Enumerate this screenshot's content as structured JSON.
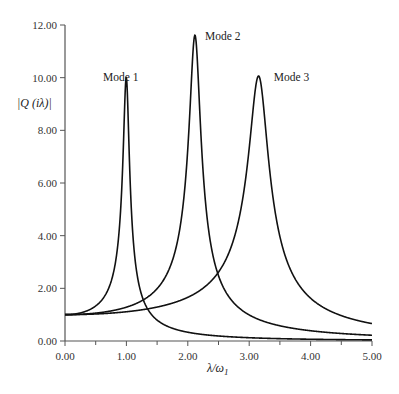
{
  "chart_data": {
    "type": "line",
    "title": "",
    "xlabel": "λ/ω1",
    "ylabel": "|Q (iλ)|",
    "xlim": [
      0,
      5
    ],
    "ylim": [
      0,
      12
    ],
    "grid": false,
    "legend": "none (inline annotations)",
    "x_ticks": [
      "0.00",
      "1.00",
      "2.00",
      "3.00",
      "4.00",
      "5.00"
    ],
    "y_ticks": [
      "0.00",
      "2.00",
      "4.00",
      "6.00",
      "8.00",
      "10.00",
      "12.00"
    ],
    "annotations": [
      {
        "text": "Mode 1",
        "x": 0.62,
        "y": 10.0
      },
      {
        "text": "Mode 2",
        "x": 2.28,
        "y": 11.55
      },
      {
        "text": "Mode 3",
        "x": 3.4,
        "y": 10.0
      }
    ],
    "series": [
      {
        "name": "Mode 1",
        "omega": 1.0,
        "peak_x": 1.0,
        "peak_y": 10.0,
        "x": [
          0,
          0.25,
          0.5,
          0.7,
          0.85,
          0.95,
          1.0,
          1.05,
          1.15,
          1.3,
          1.5,
          2.0,
          3.0,
          4.0,
          5.0
        ],
        "y": [
          1.0,
          1.07,
          1.33,
          1.95,
          3.5,
          7.2,
          10.0,
          7.4,
          3.3,
          1.45,
          0.8,
          0.33,
          0.125,
          0.067,
          0.042
        ]
      },
      {
        "name": "Mode 2",
        "omega": 2.12,
        "peak_x": 2.12,
        "peak_y": 11.6,
        "x": [
          0,
          0.5,
          1.0,
          1.3,
          1.6,
          1.8,
          1.95,
          2.05,
          2.12,
          2.2,
          2.35,
          2.6,
          3.0,
          3.5,
          4.0,
          5.0
        ],
        "y": [
          1.0,
          1.06,
          1.28,
          1.6,
          2.33,
          3.6,
          6.3,
          10.0,
          11.6,
          9.5,
          4.6,
          2.05,
          1.0,
          0.58,
          0.39,
          0.22
        ]
      },
      {
        "name": "Mode 3",
        "omega": 3.16,
        "peak_x": 3.16,
        "peak_y": 10.05,
        "x": [
          0,
          1.0,
          1.5,
          2.0,
          2.5,
          2.8,
          3.0,
          3.1,
          3.16,
          3.25,
          3.4,
          3.7,
          4.0,
          4.5,
          5.0
        ],
        "y": [
          1.0,
          1.11,
          1.29,
          1.66,
          2.64,
          4.4,
          7.2,
          9.5,
          10.05,
          8.7,
          5.2,
          2.4,
          1.55,
          0.98,
          0.67
        ]
      }
    ]
  }
}
